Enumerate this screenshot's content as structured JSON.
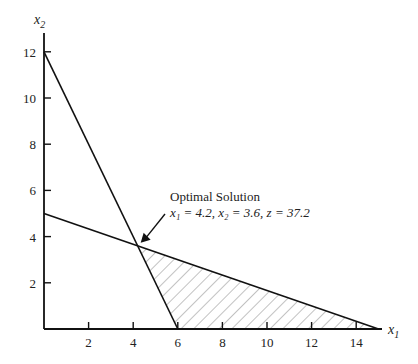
{
  "chart_data": {
    "type": "line",
    "title": "",
    "xlabel": "x1",
    "ylabel": "x2",
    "xlim": [
      0,
      15
    ],
    "ylim": [
      0,
      13
    ],
    "grid": false,
    "x_ticks": [
      2,
      4,
      6,
      8,
      10,
      12,
      14
    ],
    "y_ticks": [
      2,
      4,
      6,
      8,
      10,
      12
    ],
    "series": [
      {
        "name": "constraint-1",
        "points": [
          [
            0,
            12
          ],
          [
            6,
            0
          ]
        ]
      },
      {
        "name": "constraint-2",
        "points": [
          [
            0,
            5
          ],
          [
            15,
            0
          ]
        ]
      }
    ],
    "feasible_region": {
      "style": "hatched",
      "vertices": [
        [
          4.2,
          3.6
        ],
        [
          6,
          0
        ],
        [
          15,
          0
        ]
      ]
    },
    "annotations": [
      {
        "text": "Optimal Solution",
        "line2": "x1 = 4.2, x2 = 3.6, z = 37.2",
        "point": [
          4.2,
          3.6
        ]
      }
    ]
  },
  "labels": {
    "x_axis": "x",
    "x_axis_sub": "1",
    "y_axis": "x",
    "y_axis_sub": "2",
    "anno_title": "Optimal Solution",
    "anno_line": "x₁ = 4.2, x₂ = 3.6, z = 37.2"
  }
}
